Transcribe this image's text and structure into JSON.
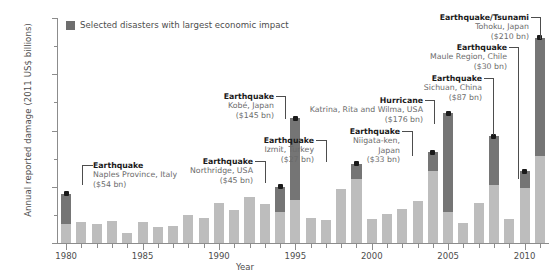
{
  "chart_data": {
    "type": "bar",
    "title": "",
    "xlabel": "Year",
    "ylabel": "Annual reported damage (2011 US$ billions)",
    "ylim": [
      0,
      400
    ],
    "yticks": [
      0,
      100,
      200,
      300,
      400
    ],
    "yticks_minor": [
      50,
      150,
      250,
      350
    ],
    "xlim": [
      1979.4,
      2011.6
    ],
    "xticks_major": [
      1980,
      1985,
      1990,
      1995,
      2000,
      2005,
      2010
    ],
    "xtick_labels": [
      "1980",
      "1985",
      "1990",
      "1995",
      "2000",
      "2005",
      "2010"
    ],
    "grid": false,
    "legend": {
      "position": "top-left",
      "entries": [
        {
          "label": "Selected disasters with largest economic impact",
          "color": "#6e6e6e"
        }
      ]
    },
    "colors": {
      "base_bar": "#bdbdbd",
      "highlight_bar": "#757575",
      "axis": "#8c8c8c",
      "text": "#4d4d4d",
      "title_text": "#1a1a1a"
    },
    "series": [
      {
        "name": "Annual reported damage (total)",
        "color": "#bdbdbd"
      },
      {
        "name": "Selected disasters with largest economic impact",
        "color": "#757575"
      }
    ],
    "categories": [
      1980,
      1981,
      1982,
      1983,
      1984,
      1985,
      1986,
      1987,
      1988,
      1989,
      1990,
      1991,
      1992,
      1993,
      1994,
      1995,
      1996,
      1997,
      1998,
      1999,
      2000,
      2001,
      2002,
      2003,
      2004,
      2005,
      2006,
      2007,
      2008,
      2009,
      2010,
      2011
    ],
    "values": [
      88,
      37,
      34,
      40,
      18,
      37,
      29,
      30,
      49,
      45,
      71,
      59,
      82,
      69,
      100,
      222,
      45,
      41,
      96,
      141,
      43,
      51,
      61,
      75,
      161,
      231,
      36,
      71,
      190,
      42,
      128,
      365
    ],
    "highlight_values": [
      54,
      0,
      0,
      0,
      0,
      0,
      0,
      0,
      0,
      0,
      0,
      0,
      0,
      0,
      45,
      145,
      0,
      0,
      0,
      27,
      0,
      0,
      0,
      0,
      33,
      176,
      0,
      0,
      87,
      0,
      30,
      210
    ],
    "annotations": [
      {
        "year": 1980,
        "title": "Earthquake",
        "lines": [
          "Naples Province, Italy",
          "($54 bn)"
        ],
        "amount": 54,
        "marker_value": 88
      },
      {
        "year": 1994,
        "title": "Earthquake",
        "lines": [
          "Northridge, USA",
          "($45 bn)"
        ],
        "amount": 45,
        "marker_value": 100
      },
      {
        "year": 1995,
        "title": "Earthquake",
        "lines": [
          "Kobé, Japan",
          "($145 bn)"
        ],
        "amount": 145,
        "marker_value": 222
      },
      {
        "year": 1999,
        "title": "Earthquake",
        "lines": [
          "Izmit, Turkey",
          "($27 bn)"
        ],
        "amount": 27,
        "marker_value": 141
      },
      {
        "year": 2004,
        "title": "Earthquake",
        "lines": [
          "Niigata-ken,",
          "Japan",
          "($33 bn)"
        ],
        "amount": 33,
        "marker_value": 161
      },
      {
        "year": 2005,
        "title": "Hurricane",
        "lines": [
          "Katrina, Rita and Wilma, USA",
          "($176 bn)"
        ],
        "amount": 176,
        "marker_value": 231
      },
      {
        "year": 2008,
        "title": "Earthquake",
        "lines": [
          "Sichuan, China",
          "($87 bn)"
        ],
        "amount": 87,
        "marker_value": 190
      },
      {
        "year": 2010,
        "title": "Earthquake",
        "lines": [
          "Maule Region, Chile",
          "($30 bn)"
        ],
        "amount": 30,
        "marker_value": 128
      },
      {
        "year": 2011,
        "title": "Earthquake/Tsunami",
        "lines": [
          "Tohoku, Japan",
          "($210 bn)"
        ],
        "amount": 210,
        "marker_value": 365
      }
    ]
  },
  "annotation_boxes": [
    {
      "id": "naples",
      "title": "Earthquake",
      "l1": "Naples Province, Italy",
      "l2": "($54 bn)",
      "l3": "",
      "left": 93,
      "top": 161,
      "align": "left",
      "leader": {
        "hx": 82,
        "hy": 165,
        "hw": 11,
        "vx": 82,
        "vy": 165,
        "vh": 20
      }
    },
    {
      "id": "northridge",
      "title": "Earthquake",
      "l1": "Northridge, USA",
      "l2": "($45 bn)",
      "l3": "",
      "left": 155,
      "top": 157,
      "width": 98,
      "align": "right",
      "leader": {
        "hx": 255,
        "hy": 161,
        "hw": 10,
        "vx": 265,
        "vy": 161,
        "vh": 22
      }
    },
    {
      "id": "kobe",
      "title": "Earthquake",
      "l1": "Kobé, Japan",
      "l2": "($145 bn)",
      "l3": "",
      "left": 196,
      "top": 92,
      "width": 78,
      "align": "right",
      "leader": {
        "hx": 276,
        "hy": 96,
        "hw": 9,
        "vx": 285,
        "vy": 96,
        "vh": 23
      }
    },
    {
      "id": "izmit",
      "title": "Earthquake",
      "l1": "Izmit, Turkey",
      "l2": "($27 bn)",
      "l3": "",
      "left": 236,
      "top": 136,
      "width": 78,
      "align": "right",
      "leader": {
        "hx": 316,
        "hy": 140,
        "hw": 10,
        "vx": 326,
        "vy": 140,
        "vh": 22
      }
    },
    {
      "id": "niigata",
      "title": "Earthquake",
      "l1": "Niigata-ken,",
      "l2": "Japan",
      "l3": "($33 bn)",
      "left": 325,
      "top": 127,
      "width": 75,
      "align": "right",
      "leader": {
        "hx": 402,
        "hy": 131,
        "hw": 10,
        "vx": 412,
        "vy": 131,
        "vh": 25
      }
    },
    {
      "id": "katrina",
      "title": "Hurricane",
      "l1": "Katrina, Rita and Wilma, USA",
      "l2": "($176 bn)",
      "l3": "",
      "left": 275,
      "top": 96,
      "width": 148,
      "align": "right",
      "leader": {
        "hx": 425,
        "hy": 100,
        "hw": 9,
        "vx": 434,
        "vy": 100,
        "vh": 24
      }
    },
    {
      "id": "sichuan",
      "title": "Earthquake",
      "l1": "Sichuan, China",
      "l2": "($87 bn)",
      "l3": "",
      "left": 390,
      "top": 74,
      "width": 92,
      "align": "right",
      "leader": {
        "hx": 484,
        "hy": 78,
        "hw": 9,
        "vx": 493,
        "vy": 78,
        "vh": 57
      }
    },
    {
      "id": "maule",
      "title": "Earthquake",
      "l1": "Maule Region, Chile",
      "l2": "($30 bn)",
      "l3": "",
      "left": 385,
      "top": 43,
      "width": 122,
      "align": "right",
      "leader": {
        "hx": 509,
        "hy": 47,
        "hw": 9,
        "vx": 518,
        "vy": 47,
        "vh": 132
      }
    },
    {
      "id": "tohoku",
      "title": "Earthquake/Tsunami",
      "l1": "Tohoku, Japan",
      "l2": "($210 bn)",
      "l3": "",
      "left": 377,
      "top": 13,
      "width": 152,
      "align": "right",
      "leader": {
        "hx": 531,
        "hy": 17,
        "hw": 9,
        "vx": 540,
        "vy": 17,
        "vh": 22
      }
    }
  ]
}
